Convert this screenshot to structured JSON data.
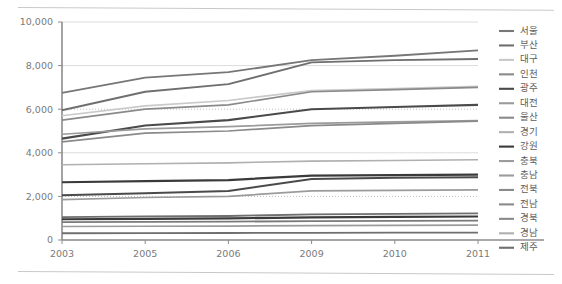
{
  "page": {
    "background_color": "#ffffff",
    "scan_rules": [
      "top-rule",
      "bottom-rule"
    ]
  },
  "chart_data": {
    "type": "line",
    "title": "",
    "subtitle": "",
    "xlabel": "",
    "ylabel": "",
    "x": [
      "2003",
      "2005",
      "2006",
      "2009",
      "2010",
      "2011"
    ],
    "categories": [
      "2003",
      "2005",
      "2006",
      "2009",
      "2010",
      "2011"
    ],
    "ylim": [
      0,
      10000
    ],
    "yticks": [
      0,
      2000,
      4000,
      6000,
      8000,
      10000
    ],
    "ytick_labels": [
      "0",
      "2,000",
      "4,000",
      "6,000",
      "8,000",
      "10,000"
    ],
    "xtick_labels": [
      "2003",
      "2005",
      "2006",
      "2009",
      "2010",
      "2011"
    ],
    "grid": true,
    "grid_axis": "y",
    "legend_position": "right",
    "series": [
      {
        "name": "서울",
        "color": "#777777",
        "width": 1.9,
        "values": [
          6750,
          7450,
          7700,
          8250,
          8450,
          8700
        ]
      },
      {
        "name": "부산",
        "color": "#6f6f6f",
        "width": 1.9,
        "values": [
          5950,
          6800,
          7150,
          8150,
          8250,
          8300
        ]
      },
      {
        "name": "대구",
        "color": "#c9c9c9",
        "width": 1.7,
        "values": [
          5700,
          6150,
          6400,
          6850,
          6950,
          7050
        ]
      },
      {
        "name": "인천",
        "color": "#8a8a8a",
        "width": 1.7,
        "values": [
          5500,
          6000,
          6200,
          6800,
          6900,
          7000
        ]
      },
      {
        "name": "광주",
        "color": "#4a4a4a",
        "width": 2.1,
        "values": [
          4650,
          5250,
          5500,
          6000,
          6100,
          6200
        ]
      },
      {
        "name": "대전",
        "color": "#9b9b9b",
        "width": 1.7,
        "values": [
          4850,
          5100,
          5200,
          5350,
          5420,
          5480
        ]
      },
      {
        "name": "울산",
        "color": "#8a8a8a",
        "width": 1.7,
        "values": [
          4500,
          4900,
          5000,
          5250,
          5350,
          5450
        ]
      },
      {
        "name": "경기",
        "color": "#b0b0b0",
        "width": 1.6,
        "values": [
          3450,
          3500,
          3540,
          3620,
          3650,
          3680
        ]
      },
      {
        "name": "강원",
        "color": "#3a3a3a",
        "width": 2.2,
        "values": [
          2650,
          2700,
          2750,
          2950,
          2980,
          3000
        ]
      },
      {
        "name": "충북",
        "color": "#4a4a4a",
        "width": 2.0,
        "values": [
          2050,
          2150,
          2250,
          2800,
          2850,
          2880
        ]
      },
      {
        "name": "충남",
        "color": "#9b9b9b",
        "width": 1.7,
        "values": [
          1850,
          1950,
          2000,
          2250,
          2280,
          2300
        ]
      },
      {
        "name": "전북",
        "color": "#6f6f6f",
        "width": 1.8,
        "values": [
          1050,
          1080,
          1100,
          1180,
          1200,
          1220
        ]
      },
      {
        "name": "전남",
        "color": "#3a3a3a",
        "width": 2.1,
        "values": [
          950,
          970,
          990,
          1040,
          1060,
          1080
        ]
      },
      {
        "name": "경북",
        "color": "#7a7a7a",
        "width": 1.8,
        "values": [
          820,
          830,
          840,
          870,
          880,
          890
        ]
      },
      {
        "name": "경남",
        "color": "#9b9b9b",
        "width": 1.7,
        "values": [
          620,
          630,
          640,
          660,
          670,
          680
        ]
      },
      {
        "name": "제주",
        "color": "#6f6f6f",
        "width": 1.8,
        "values": [
          310,
          315,
          320,
          330,
          335,
          340
        ]
      }
    ]
  },
  "legend": {
    "items": [
      {
        "label": "서울",
        "color": "#777777"
      },
      {
        "label": "부산",
        "color": "#6f6f6f"
      },
      {
        "label": "대구",
        "color": "#c9c9c9"
      },
      {
        "label": "인천",
        "color": "#8a8a8a"
      },
      {
        "label": "광주",
        "color": "#4a4a4a"
      },
      {
        "label": "대전",
        "color": "#9b9b9b"
      },
      {
        "label": "울산",
        "color": "#8a8a8a"
      },
      {
        "label": "경기",
        "color": "#b0b0b0"
      },
      {
        "label": "강원",
        "color": "#3a3a3a"
      },
      {
        "label": "충북",
        "color": "#9b9b9b"
      },
      {
        "label": "충남",
        "color": "#9b9b9b"
      },
      {
        "label": "전북",
        "color": "#8a8a8a"
      },
      {
        "label": "전남",
        "color": "#8a8a8a"
      },
      {
        "label": "경북",
        "color": "#8a8a8a"
      },
      {
        "label": "경남",
        "color": "#b0b0b0"
      },
      {
        "label": "제주",
        "color": "#6f6f6f"
      }
    ]
  },
  "axes": {
    "axis_color": "#8c8c8c",
    "grid_color": "#dcdcdc",
    "tick_text_color": "#7a7a7a"
  }
}
